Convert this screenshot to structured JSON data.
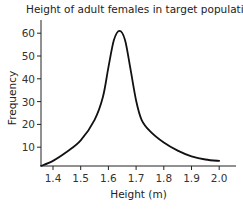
{
  "chart_data": {
    "type": "line",
    "title": "Height of adult females in target population",
    "xlabel": "Height (m)",
    "ylabel": "Frequency",
    "xlim": [
      1.357,
      2.06
    ],
    "ylim": [
      1.8,
      66
    ],
    "x_ticks": [
      1.4,
      1.5,
      1.6,
      1.7,
      1.8,
      1.9,
      2.0
    ],
    "x_tick_labels": [
      "1.4",
      "1.5",
      "1.6",
      "1.7",
      "1.8",
      "1.9",
      "2.0"
    ],
    "y_ticks": [
      10,
      20,
      30,
      40,
      50,
      60
    ],
    "y_tick_labels": [
      "10",
      "20",
      "30",
      "40",
      "50",
      "60"
    ],
    "grid": false,
    "legend": null,
    "series": [
      {
        "name": "Height distribution",
        "x": [
          1.357,
          1.4,
          1.45,
          1.5,
          1.55,
          1.58,
          1.6,
          1.62,
          1.64,
          1.66,
          1.68,
          1.7,
          1.72,
          1.75,
          1.8,
          1.85,
          1.9,
          1.95,
          2.0
        ],
        "y": [
          1.8,
          4,
          8,
          13,
          22,
          32,
          45,
          57,
          61,
          57,
          44,
          30.5,
          22,
          17,
          12,
          8.5,
          6,
          4.6,
          4
        ]
      }
    ]
  }
}
